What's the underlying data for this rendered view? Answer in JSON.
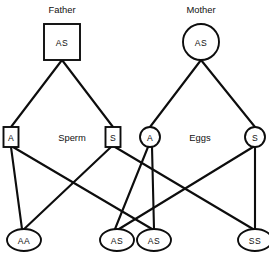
{
  "diagram": {
    "type": "genetic-inheritance-cross",
    "stroke_color": "#0d0d0d",
    "text_color": "#111111",
    "background_color": "#ffffff",
    "parents": [
      {
        "id": "father",
        "title": "Father",
        "genotype": "AS",
        "shape": "square",
        "cx": 62,
        "cy": 42,
        "w": 36,
        "h": 36,
        "title_x": 62,
        "title_y": 9
      },
      {
        "id": "mother",
        "title": "Mother",
        "genotype": "AS",
        "shape": "circle",
        "cx": 201,
        "cy": 42,
        "r": 18,
        "title_x": 201,
        "title_y": 9
      }
    ],
    "gamete_groups": [
      {
        "id": "sperm",
        "label": "Sperm",
        "label_x": 72,
        "label_y": 137
      },
      {
        "id": "eggs",
        "label": "Eggs",
        "label_x": 200,
        "label_y": 137
      }
    ],
    "gametes": [
      {
        "id": "sperm-a",
        "allele": "A",
        "shape": "square",
        "cx": 11,
        "cy": 137,
        "w": 15,
        "h": 20,
        "parent": "father"
      },
      {
        "id": "sperm-s",
        "allele": "S",
        "shape": "square",
        "cx": 113,
        "cy": 137,
        "w": 15,
        "h": 20,
        "parent": "father"
      },
      {
        "id": "egg-a",
        "allele": "A",
        "shape": "circle",
        "cx": 150,
        "cy": 137,
        "r": 10,
        "parent": "mother"
      },
      {
        "id": "egg-s",
        "allele": "S",
        "shape": "circle",
        "cx": 255,
        "cy": 137,
        "r": 10,
        "parent": "mother"
      }
    ],
    "offspring": [
      {
        "id": "child-aa",
        "genotype": "AA",
        "shape": "ellipse",
        "cx": 24,
        "cy": 240,
        "rx": 17,
        "ry": 11
      },
      {
        "id": "child-as-1",
        "genotype": "AS",
        "shape": "ellipse",
        "cx": 117,
        "cy": 240,
        "rx": 17,
        "ry": 11
      },
      {
        "id": "child-as-2",
        "genotype": "AS",
        "shape": "ellipse",
        "cx": 154,
        "cy": 240,
        "rx": 17,
        "ry": 11
      },
      {
        "id": "child-ss",
        "genotype": "SS",
        "shape": "ellipse",
        "cx": 255,
        "cy": 240,
        "rx": 17,
        "ry": 11
      }
    ],
    "edges": [
      {
        "id": "father-to-sperm-a",
        "x1": 62,
        "y1": 60,
        "x2": 11,
        "y2": 127
      },
      {
        "id": "father-to-sperm-s",
        "x1": 62,
        "y1": 60,
        "x2": 113,
        "y2": 127
      },
      {
        "id": "mother-to-egg-a",
        "x1": 201,
        "y1": 60,
        "x2": 150,
        "y2": 127
      },
      {
        "id": "mother-to-egg-s",
        "x1": 201,
        "y1": 60,
        "x2": 255,
        "y2": 127
      },
      {
        "id": "sperm-a-to-child-aa",
        "x1": 11,
        "y1": 147,
        "x2": 22,
        "y2": 229
      },
      {
        "id": "sperm-a-to-child-as-2",
        "x1": 13,
        "y1": 147,
        "x2": 152,
        "y2": 229
      },
      {
        "id": "sperm-s-to-child-as-1",
        "x1": 111,
        "y1": 147,
        "x2": 22,
        "y2": 231
      },
      {
        "id": "sperm-s-to-child-ss",
        "x1": 115,
        "y1": 147,
        "x2": 253,
        "y2": 229
      },
      {
        "id": "egg-a-to-child-as-1",
        "x1": 148,
        "y1": 147,
        "x2": 115,
        "y2": 229
      },
      {
        "id": "egg-a-to-child-as-2",
        "x1": 152,
        "y1": 147,
        "x2": 154,
        "y2": 229
      },
      {
        "id": "egg-s-to-child-as-2",
        "x1": 253,
        "y1": 147,
        "x2": 119,
        "y2": 229
      },
      {
        "id": "egg-s-to-child-ss",
        "x1": 255,
        "y1": 147,
        "x2": 255,
        "y2": 229
      }
    ],
    "caption": {
      "text": "",
      "x": 134,
      "y": 261
    }
  }
}
